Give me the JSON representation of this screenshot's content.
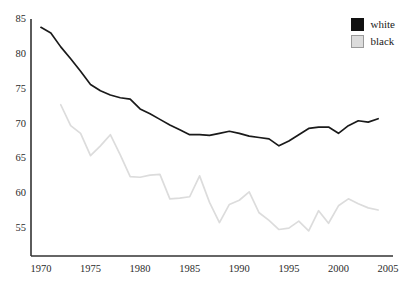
{
  "chart_data": {
    "type": "line",
    "title": "",
    "xlabel": "",
    "ylabel": "",
    "xlim": [
      1969,
      2005.5
    ],
    "ylim": [
      51,
      85
    ],
    "grid": false,
    "legend_position": "top-right",
    "xticks": [
      1970,
      1975,
      1980,
      1985,
      1990,
      1995,
      2000,
      2005
    ],
    "xtick_labels": [
      "1970",
      "1975",
      "1980",
      "1985",
      "1990",
      "1995",
      "2000",
      "2005"
    ],
    "yticks": [
      55,
      60,
      65,
      70,
      75,
      80,
      85
    ],
    "ytick_labels": [
      "55",
      "60",
      "65",
      "70",
      "75",
      "80",
      "85"
    ],
    "series": [
      {
        "name": "white",
        "color": "#1a1a1a",
        "x": [
          1970,
          1971,
          1972,
          1973,
          1974,
          1975,
          1976,
          1977,
          1978,
          1979,
          1980,
          1981,
          1982,
          1983,
          1984,
          1985,
          1986,
          1987,
          1988,
          1989,
          1990,
          1991,
          1992,
          1993,
          1994,
          1995,
          1996,
          1997,
          1998,
          1999,
          2000,
          2001,
          2002,
          2003,
          2004
        ],
        "values": [
          83.8,
          83.0,
          81.0,
          79.3,
          77.5,
          75.6,
          74.7,
          74.1,
          73.7,
          73.5,
          72.1,
          71.4,
          70.6,
          69.8,
          69.1,
          68.4,
          68.4,
          68.3,
          68.6,
          68.9,
          68.6,
          68.2,
          68.0,
          67.8,
          66.8,
          67.5,
          68.4,
          69.3,
          69.5,
          69.5,
          68.6,
          69.7,
          70.4,
          70.2,
          70.7
        ]
      },
      {
        "name": "black",
        "color": "#dcdcdc",
        "x": [
          1972,
          1973,
          1974,
          1975,
          1976,
          1977,
          1978,
          1979,
          1980,
          1981,
          1982,
          1983,
          1984,
          1985,
          1986,
          1987,
          1988,
          1989,
          1990,
          1991,
          1992,
          1993,
          1994,
          1995,
          1996,
          1997,
          1998,
          1999,
          2000,
          2001,
          2002,
          2003,
          2004
        ],
        "values": [
          72.7,
          69.7,
          68.6,
          65.4,
          66.8,
          68.4,
          65.5,
          62.4,
          62.3,
          62.6,
          62.7,
          59.2,
          59.3,
          59.5,
          62.5,
          58.7,
          55.8,
          58.4,
          59.0,
          60.2,
          57.2,
          56.1,
          54.8,
          55.0,
          56.0,
          54.6,
          57.5,
          55.7,
          58.2,
          59.2,
          58.5,
          57.9,
          57.6
        ]
      }
    ]
  },
  "legend": {
    "items": [
      {
        "label": "white",
        "color": "#111111",
        "border": "#111111"
      },
      {
        "label": "black",
        "color": "#dcdcdc",
        "border": "#9a9a9a"
      }
    ]
  },
  "axes": {
    "axis_color": "#333333"
  }
}
